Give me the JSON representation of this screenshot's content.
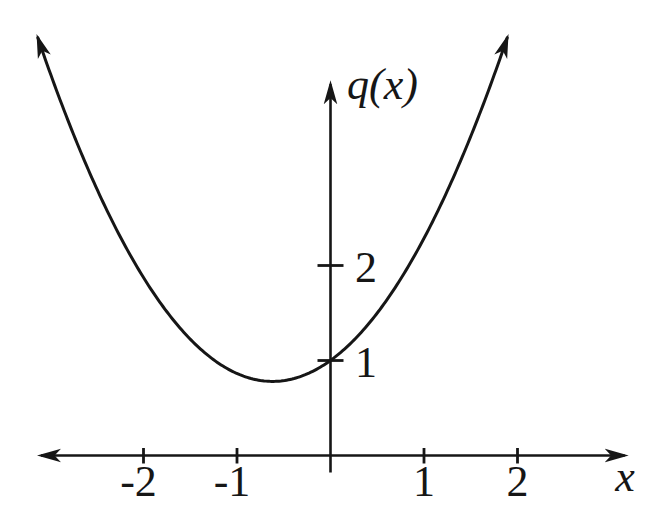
{
  "figure": {
    "background": "#ffffff",
    "ink": "#161616"
  },
  "chart_data": {
    "type": "line",
    "title": "",
    "xlabel": "x",
    "ylabel": "q(x)",
    "grid": false,
    "legend": false,
    "x_axis_extent": [
      -3.15,
      3.2
    ],
    "y_axis_extent": [
      -0.18,
      3.96
    ],
    "x_ticks": [
      {
        "value": -2,
        "label": "-2"
      },
      {
        "value": -1,
        "label": "-1"
      },
      {
        "value": 1,
        "label": "1"
      },
      {
        "value": 2,
        "label": "2"
      }
    ],
    "y_ticks": [
      {
        "value": 1,
        "label": "1"
      },
      {
        "value": 2,
        "label": "2"
      }
    ],
    "series": [
      {
        "name": "q(x)",
        "shape": "parabola",
        "a": 0.574,
        "vertex": [
          -0.62,
          0.78
        ],
        "y_intercept": [
          0,
          1
        ],
        "domain_shown": [
          -3.13,
          1.9
        ],
        "arrow_ends": true,
        "points": [
          [
            -3.13,
            4.41
          ],
          [
            -3,
            4.05
          ],
          [
            -2.5,
            2.82
          ],
          [
            -2,
            1.88
          ],
          [
            -1.5,
            1.23
          ],
          [
            -1,
            0.87
          ],
          [
            -0.62,
            0.78
          ],
          [
            0,
            1
          ],
          [
            0.5,
            1.5
          ],
          [
            1,
            2.28
          ],
          [
            1.5,
            3.35
          ],
          [
            1.9,
            4.41
          ]
        ]
      }
    ]
  }
}
